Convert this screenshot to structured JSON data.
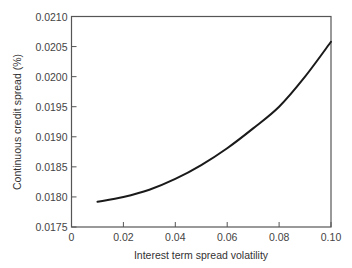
{
  "chart_data": {
    "type": "line",
    "title": "",
    "xlabel": "Interest term spread volatility",
    "ylabel": "Continuous credit spread (%)",
    "xlim": [
      0,
      0.1
    ],
    "ylim": [
      0.0175,
      0.021
    ],
    "grid": false,
    "legend": null,
    "x_ticks": [
      0,
      0.02,
      0.04,
      0.06,
      0.08,
      0.1
    ],
    "x_tick_labels": [
      "0",
      "0.02",
      "0.04",
      "0.06",
      "0.08",
      "0.10"
    ],
    "y_ticks": [
      0.0175,
      0.018,
      0.0185,
      0.019,
      0.0195,
      0.02,
      0.0205,
      0.021
    ],
    "y_tick_labels": [
      "0.0175",
      "0.0180",
      "0.0185",
      "0.0190",
      "0.0195",
      "0.0200",
      "0.0205",
      "0.0210"
    ],
    "series": [
      {
        "name": "Continuous credit spread",
        "color": "#1a1a1a",
        "x": [
          0.01,
          0.02,
          0.03,
          0.04,
          0.05,
          0.06,
          0.07,
          0.08,
          0.09,
          0.1
        ],
        "y": [
          0.01792,
          0.018,
          0.01812,
          0.0183,
          0.01853,
          0.01881,
          0.01914,
          0.0195,
          0.02,
          0.02058
        ]
      }
    ]
  }
}
